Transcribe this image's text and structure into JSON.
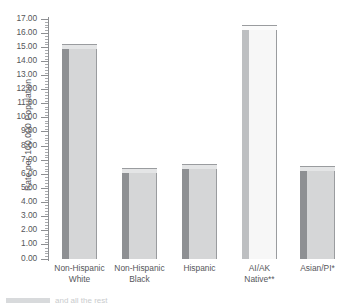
{
  "chart_data": {
    "type": "bar",
    "title": "",
    "subtitle": "",
    "xlabel": "",
    "ylabel": "Rate per 100,000 Population",
    "categories": [
      "Non-Hispanic White",
      "Non-Hispanic Black",
      "Hispanic",
      "AI/AK Native**",
      "Asian/PI*"
    ],
    "category_lines": [
      [
        "Non-Hispanic",
        "White"
      ],
      [
        "Non-Hispanic",
        "Black"
      ],
      [
        "Hispanic",
        ""
      ],
      [
        "AI/AK",
        "Native**"
      ],
      [
        "Asian/PI*",
        ""
      ]
    ],
    "values": [
      14.9,
      6.1,
      6.4,
      16.2,
      6.2
    ],
    "ylim": [
      0.0,
      17.0
    ],
    "ytick_step": 1.0,
    "ytick_labels": [
      "17.00",
      "16.00",
      "15.00",
      "14.00",
      "13.00",
      "12.00",
      "11.00",
      "10.00",
      "9.00",
      "8.00",
      "7.00",
      "6.00",
      "5.00",
      "4.00",
      "3.00",
      "2.00",
      "1.00",
      "0.00"
    ],
    "minor_ticks_per_interval": 4,
    "grid": false,
    "legend": null,
    "bar_colors": [
      "#d5d6d7",
      "#d5d6d7",
      "#d5d6d7",
      "#f7f7f7",
      "#d5d6d7"
    ],
    "bar_side_colors": [
      "#8e9093",
      "#8e9093",
      "#8e9093",
      "#bdbfc1",
      "#8e9093"
    ],
    "bar_top_colors": [
      "#e4e5e6",
      "#e4e5e6",
      "#e4e5e6",
      "#fbfbfb",
      "#e4e5e6"
    ],
    "bar_border_color": "#9a9c9f"
  },
  "colors": {
    "axis": "#8d8f92",
    "text": "#55565a",
    "background": "#ffffff",
    "footer_strip": "#d8dadc"
  },
  "footer": {
    "clipped_text": "and all the rest"
  }
}
